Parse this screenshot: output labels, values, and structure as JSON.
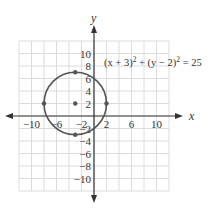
{
  "chart_data": {
    "type": "scatter",
    "title": "",
    "xlabel": "x",
    "ylabel": "y",
    "xlim": [
      -12,
      12
    ],
    "ylim": [
      -12,
      12
    ],
    "grid": true,
    "grid_step": 2,
    "x_tick_labels": [
      "-10",
      "-6",
      "-2",
      "2",
      "6",
      "10"
    ],
    "y_tick_labels": [
      "10",
      "8",
      "6",
      "4",
      "2",
      "-2",
      "-4",
      "-6",
      "-8",
      "-10"
    ],
    "annotation": "(x + 3)² + (y − 2)² = 25",
    "circle": {
      "center": [
        -3,
        2
      ],
      "radius": 5
    },
    "points": [
      {
        "x": -3,
        "y": 7
      },
      {
        "x": -8,
        "y": 2
      },
      {
        "x": 2,
        "y": 2
      },
      {
        "x": -3,
        "y": -3
      },
      {
        "x": -3,
        "y": 2
      }
    ]
  },
  "labels": {
    "x_axis": "x",
    "y_axis": "y",
    "equation_prefix": "(x + 3)",
    "equation_mid": " + (y − 2)",
    "equation_suffix": " = 25",
    "sup": "2"
  },
  "colors": {
    "curve": "#555555",
    "grid": "#dcdcdc",
    "axis": "#333333"
  }
}
